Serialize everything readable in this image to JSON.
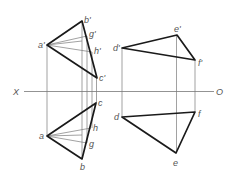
{
  "diagram": {
    "type": "orthographic-projection",
    "axis": {
      "left_label": "X",
      "right_label": "O",
      "y": 91.5,
      "x1": 24,
      "x2": 214
    },
    "colors": {
      "thick": "#1a1a1a",
      "thin": "#7a7a7a",
      "label": "#555555"
    },
    "left_figure": {
      "front_view": {
        "points": {
          "a'": [
            47,
            45
          ],
          "b'": [
            82,
            21
          ],
          "c'": [
            97,
            78
          ],
          "g'": [
            87,
            36
          ],
          "h'": [
            92,
            52
          ]
        },
        "labels": {
          "a": "a'",
          "b": "b'",
          "c": "c'",
          "g": "g'",
          "h": "h'"
        }
      },
      "top_view": {
        "points": {
          "a": [
            47,
            136
          ],
          "b": [
            82,
            159
          ],
          "c": [
            96,
            103
          ],
          "h": [
            91,
            128
          ],
          "g": [
            87,
            143
          ]
        },
        "labels": {
          "a": "a",
          "b": "b",
          "c": "c",
          "g": "g",
          "h": "h"
        }
      }
    },
    "right_figure": {
      "front_view": {
        "points": {
          "d'": [
            122,
            48
          ],
          "e'": [
            177,
            35
          ],
          "f'": [
            195,
            60
          ]
        },
        "labels": {
          "d": "d'",
          "e": "e'",
          "f": "f'"
        }
      },
      "top_view": {
        "points": {
          "d": [
            122,
            117
          ],
          "e": [
            176,
            153
          ],
          "f": [
            195,
            112
          ]
        },
        "labels": {
          "d": "d",
          "e": "e",
          "f": "f"
        }
      }
    }
  }
}
